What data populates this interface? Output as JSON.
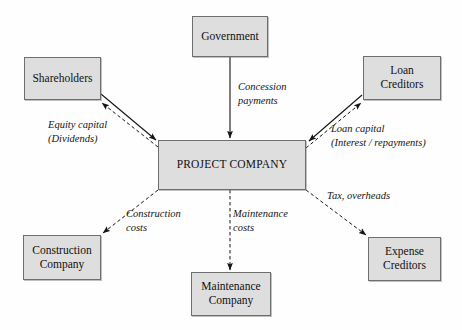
{
  "diagram": {
    "canvas": {
      "width": 462,
      "height": 330
    },
    "colors": {
      "box_fill": "#dedede",
      "box_border": "#6e6e6e",
      "line": "#1a1a1a",
      "background": "#fefefe"
    },
    "nodes": [
      {
        "id": "government",
        "label": "Government"
      },
      {
        "id": "shareholders",
        "label": "Shareholders"
      },
      {
        "id": "loan_creditors",
        "label": "Loan\nCreditors"
      },
      {
        "id": "project_company",
        "label": "PROJECT COMPANY"
      },
      {
        "id": "construction_company",
        "label": "Construction\nCompany"
      },
      {
        "id": "maintenance_company",
        "label": "Maintenance\nCompany"
      },
      {
        "id": "expense_creditors",
        "label": "Expense\nCreditors"
      }
    ],
    "edges": [
      {
        "id": "concession",
        "label": "Concession\npayments",
        "from": "government",
        "to": "project_company",
        "style": "solid"
      },
      {
        "id": "equity_in",
        "label": "Equity capital\n(Dividends)",
        "from": "shareholders",
        "to": "project_company",
        "style": "solid"
      },
      {
        "id": "dividends",
        "label": "",
        "from": "project_company",
        "to": "shareholders",
        "style": "dashed"
      },
      {
        "id": "loan_in",
        "label": "Loan capital\n(Interest / repayments)",
        "from": "loan_creditors",
        "to": "project_company",
        "style": "solid"
      },
      {
        "id": "loan_repay",
        "label": "",
        "from": "project_company",
        "to": "loan_creditors",
        "style": "dashed"
      },
      {
        "id": "construction",
        "label": "Construction\ncosts",
        "from": "project_company",
        "to": "construction_company",
        "style": "dashed"
      },
      {
        "id": "maintenance",
        "label": "Maintenance\ncosts",
        "from": "project_company",
        "to": "maintenance_company",
        "style": "dashed"
      },
      {
        "id": "tax",
        "label": "Tax, overheads",
        "from": "project_company",
        "to": "expense_creditors",
        "style": "dashed"
      }
    ]
  }
}
